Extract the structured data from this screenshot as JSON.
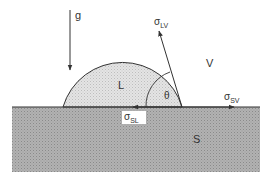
{
  "diagram": {
    "labels": {
      "gravity": "g",
      "liquid": "L",
      "vapor": "V",
      "solid": "S",
      "angle": "θ",
      "sigma": "σ",
      "lv_sub": "LV",
      "sl_sub": "SL",
      "sv_sub": "SV"
    },
    "colors": {
      "line": "#333333",
      "liquid_fill": "#d9d9d9",
      "solid_fill": "#a6a6a6",
      "background": "#ffffff"
    }
  }
}
